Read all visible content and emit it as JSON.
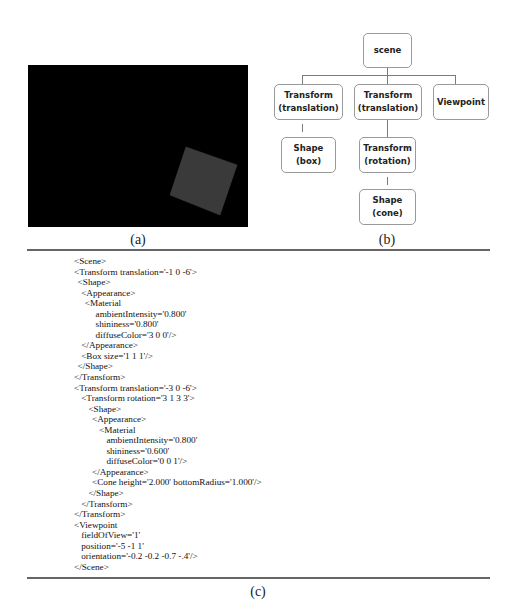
{
  "panel_a": {
    "caption": "(a)",
    "description": "Rendered X3D scene: black viewport with a tilted dark-gray box",
    "background_color": "#000000",
    "shape_color": "#3a3a3a"
  },
  "panel_b": {
    "caption": "(b)",
    "nodes": {
      "scene": {
        "line1": "scene",
        "line2": ""
      },
      "transform1": {
        "line1": "Transform",
        "line2": "(translation)"
      },
      "transform2": {
        "line1": "Transform",
        "line2": "(translation)"
      },
      "viewpoint": {
        "line1": "Viewpoint",
        "line2": ""
      },
      "shape_box": {
        "line1": "Shape",
        "line2": "(box)"
      },
      "transform_rotation": {
        "line1": "Transform",
        "line2": "(rotation)"
      },
      "shape_cone": {
        "line1": "Shape",
        "line2": "(cone)"
      }
    }
  },
  "panel_c": {
    "caption": "(c)",
    "code_lines": [
      {
        "indent": 0,
        "text": "<Scene>"
      },
      {
        "indent": 0,
        "text": "<Transform translation='-1 0 -6'>"
      },
      {
        "indent": 1,
        "text": "<Shape>"
      },
      {
        "indent": 2,
        "text": "<Appearance>"
      },
      {
        "indent": 3,
        "text": "<Material"
      },
      {
        "indent": 6,
        "text": "ambientIntensity='0.800'"
      },
      {
        "indent": 6,
        "text": "shininess='0.800'"
      },
      {
        "indent": 6,
        "text": "diffuseColor='3 0 0'/>"
      },
      {
        "indent": 2,
        "text": "</Appearance>"
      },
      {
        "indent": 2,
        "text": "<Box size='1 1 1'/>"
      },
      {
        "indent": 1,
        "text": "</Shape>"
      },
      {
        "indent": 0,
        "text": "</Transform>"
      },
      {
        "indent": 0,
        "text": "<Transform translation='-3 0 -6'>"
      },
      {
        "indent": 2,
        "text": "<Transform rotation='3 1 3 3'>"
      },
      {
        "indent": 4,
        "text": "<Shape>"
      },
      {
        "indent": 5,
        "text": "<Appearance>"
      },
      {
        "indent": 7,
        "text": "<Material"
      },
      {
        "indent": 9,
        "text": "ambientIntensity='0.800'"
      },
      {
        "indent": 9,
        "text": "shininess='0.600'"
      },
      {
        "indent": 9,
        "text": "diffuseColor='0 0 1'/>"
      },
      {
        "indent": 5,
        "text": "</Appearance>"
      },
      {
        "indent": 5,
        "text": "<Cone height='2.000' bottomRadius='1.000'/>"
      },
      {
        "indent": 4,
        "text": "</Shape>"
      },
      {
        "indent": 2,
        "text": "</Transform>"
      },
      {
        "indent": 0,
        "text": "</Transform>"
      },
      {
        "indent": 0,
        "text": "<Viewpoint"
      },
      {
        "indent": 2,
        "text": "fieldOfView='1'"
      },
      {
        "indent": 2,
        "text": "position='-5 -1 1'"
      },
      {
        "indent": 2,
        "text": "orientation='-0.2 -0.2 -0.7 -.4'/>"
      },
      {
        "indent": 0,
        "text": "</Scene>"
      }
    ]
  }
}
